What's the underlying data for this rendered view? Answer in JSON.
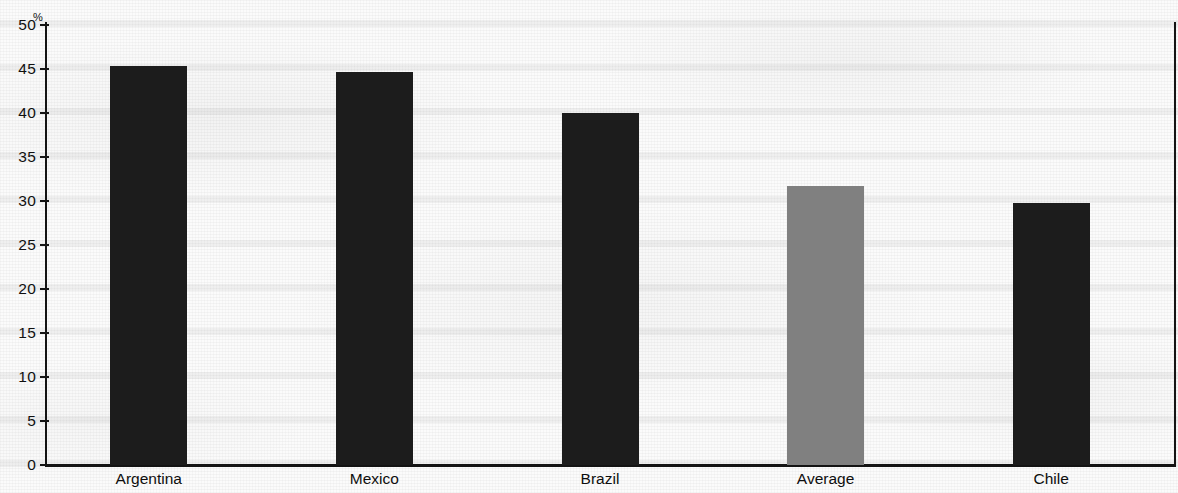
{
  "chart_data": {
    "type": "bar",
    "title": "",
    "subtitle": "",
    "xlabel": "",
    "ylabel": "",
    "unit_label": "%",
    "categories": [
      "Argentina",
      "Mexico",
      "Brazil",
      "Average",
      "Chile"
    ],
    "values": [
      45.3,
      44.7,
      40.0,
      31.7,
      29.8
    ],
    "series": [
      {
        "name": "",
        "values": [
          45.3,
          44.7,
          40.0,
          31.7,
          29.8
        ]
      }
    ],
    "bar_colors": [
      "#1c1c1c",
      "#1c1c1c",
      "#1c1c1c",
      "#808080",
      "#1c1c1c"
    ],
    "highlight_category": "Average",
    "ylim": [
      0,
      50
    ],
    "ytick_values": [
      0,
      5,
      10,
      15,
      20,
      25,
      30,
      35,
      40,
      45,
      50
    ],
    "ytick_labels": [
      "0",
      "5",
      "10",
      "15",
      "20",
      "25",
      "30",
      "35",
      "40",
      "45",
      "50"
    ],
    "grid": false,
    "legend": false,
    "legend_position": "none",
    "annotations": []
  },
  "colors": {
    "bar_dark": "#1c1c1c",
    "bar_gray": "#808080",
    "axis": "#141414",
    "text": "#101010",
    "background": "#fbfbfb"
  }
}
